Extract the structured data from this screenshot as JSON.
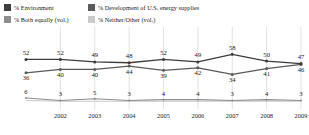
{
  "legend": {
    "items": [
      {
        "label": "% Environment",
        "color": "#3d3d3d",
        "marker": "legend-swatch-environment"
      },
      {
        "label": "% Development of U.S. energy supplies",
        "color": "#5a5a5a",
        "marker": "legend-swatch-energy"
      },
      {
        "label": "% Both equally (vol.)",
        "color": "#8d8d8d",
        "marker": "legend-swatch-both-equally"
      },
      {
        "label": "% Neither/Other (vol.)",
        "color": "#c9c9c9",
        "marker": "legend-swatch-neither-other"
      }
    ]
  },
  "footnote": {
    "text": ""
  },
  "chart_data": {
    "type": "line",
    "title": "",
    "subtitle": "",
    "xlabel": "",
    "ylabel": "",
    "ylim": [
      0,
      62
    ],
    "grid": true,
    "grid_orientation": "vertical",
    "legend_position": "top",
    "x": [
      "2001",
      "2002",
      "2003",
      "2004",
      "2005",
      "2006",
      "2007",
      "2008",
      "2009"
    ],
    "tick_labels": [
      "",
      "2002",
      "2003",
      "2004",
      "2005",
      "2006",
      "2007",
      "2008",
      "2009"
    ],
    "series": [
      {
        "name": "% Environment",
        "color": "#3d3d3d",
        "values": [
          52,
          52,
          49,
          48,
          52,
          49,
          58,
          50,
          47
        ],
        "labels": [
          "52",
          "52",
          "49",
          "48",
          "52",
          "49",
          "58",
          "50",
          "47"
        ]
      },
      {
        "name": "% Development of U.S. energy supplies",
        "color": "#5a5a5a",
        "values": [
          36,
          40,
          40,
          44,
          39,
          42,
          34,
          41,
          46
        ],
        "labels": [
          "36",
          "40",
          "40",
          "44",
          "39",
          "42",
          "34",
          "41",
          "46"
        ]
      },
      {
        "name": "% Both equally (vol.)",
        "color": "#8d8d8d",
        "values": [
          6,
          3,
          5,
          3,
          4,
          4,
          3,
          4,
          3
        ],
        "labels": [
          "6",
          "3",
          "5",
          "3",
          "4",
          "4",
          "3",
          "4",
          "3"
        ]
      },
      {
        "name": "% Neither/Other (vol.)",
        "color": "#c9c9c9",
        "values": [
          3,
          2,
          2,
          2,
          2,
          2,
          2,
          2,
          2
        ],
        "labels": [
          "",
          "",
          "",
          "",
          "",
          "",
          "",
          "",
          ""
        ]
      }
    ]
  }
}
